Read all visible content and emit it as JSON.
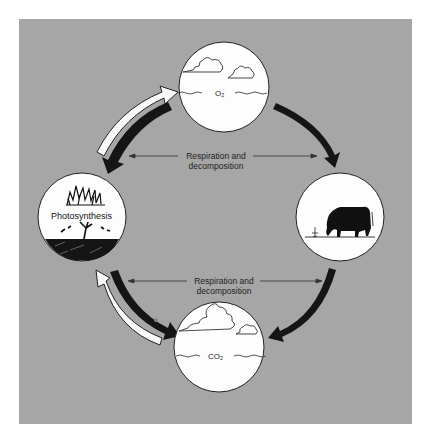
{
  "diagram": {
    "type": "cycle",
    "title": "",
    "background": "#a6a6a6",
    "nodes": [
      {
        "id": "atmosphere-o2",
        "position": "top",
        "label": "O₂",
        "depicts": "clouds over water"
      },
      {
        "id": "plants",
        "position": "left",
        "label": "Photosynthesis",
        "depicts": "shrubs and tree on soil"
      },
      {
        "id": "animal",
        "position": "right",
        "label": "",
        "depicts": "grazing cow"
      },
      {
        "id": "atmosphere-co2",
        "position": "bottom",
        "label": "CO₂",
        "depicts": "clouds over water"
      }
    ],
    "annotations": [
      {
        "text_line1": "Respiration and",
        "text_line2": "decomposition",
        "position": "upper-center"
      },
      {
        "text_line1": "Respiration and",
        "text_line2": "decomposition",
        "position": "lower-center"
      }
    ],
    "edges": [
      {
        "from": "plants",
        "to": "atmosphere-o2",
        "style": "white-arrow"
      },
      {
        "from": "atmosphere-o2",
        "to": "plants",
        "style": "black-arrow"
      },
      {
        "from": "atmosphere-o2",
        "to": "animal",
        "style": "black-arrow"
      },
      {
        "from": "animal",
        "to": "atmosphere-co2",
        "style": "black-arrow"
      },
      {
        "from": "plants",
        "to": "atmosphere-co2",
        "style": "black-arrow"
      },
      {
        "from": "atmosphere-co2",
        "to": "plants",
        "style": "white-arrow"
      }
    ]
  }
}
